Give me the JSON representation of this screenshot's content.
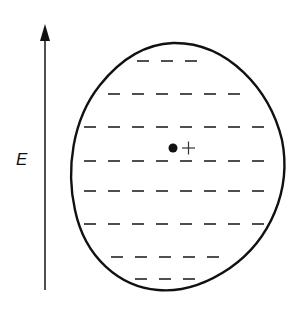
{
  "diagram": {
    "field_label": "E",
    "field_arrow": {
      "x": 45,
      "y_tail": 290,
      "y_head": 24,
      "direction": "up"
    },
    "body": {
      "shape": "oval-conductor",
      "outline_color": "#111111"
    },
    "charge_rows": [
      {
        "y": 61,
        "sign": "-",
        "x_start": 137,
        "count": 3
      },
      {
        "y": 94,
        "sign": "-",
        "x_start": 108,
        "count": 6
      },
      {
        "y": 127,
        "sign": "-",
        "x_start": 84,
        "count": 8
      },
      {
        "y": 161,
        "sign": "-",
        "x_start": 84,
        "count": 8
      },
      {
        "y": 191,
        "sign": "-",
        "x_start": 84,
        "count": 8
      },
      {
        "y": 224,
        "sign": "-",
        "x_start": 84,
        "count": 8
      },
      {
        "y": 257,
        "sign": "-",
        "x_start": 111,
        "count": 5
      },
      {
        "y": 279,
        "sign": "-",
        "x_start": 135,
        "count": 3
      }
    ],
    "center_dot": {
      "x": 173,
      "y": 148
    },
    "center_plus": {
      "x": 188,
      "y": 148
    }
  }
}
